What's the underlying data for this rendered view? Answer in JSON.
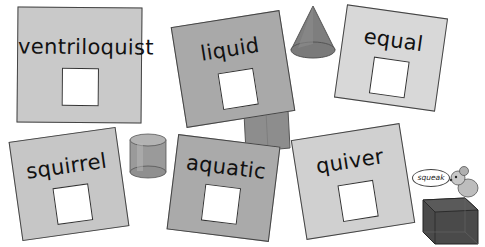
{
  "cards": [
    {
      "word": "ventriloquist",
      "color": "#c9c9c9"
    },
    {
      "word": "liquid",
      "color": "#a9a9a9"
    },
    {
      "word": "equal",
      "color": "#d8d8d8"
    },
    {
      "word": "squirrel",
      "color": "#c6c6c6"
    },
    {
      "word": "aquatic",
      "color": "#aaaaaa"
    },
    {
      "word": "quiver",
      "color": "#d0d0d0"
    }
  ],
  "mouse": {
    "speech": "squeak"
  },
  "shapes": [
    "cone",
    "cylinder",
    "cuboid",
    "cube"
  ]
}
